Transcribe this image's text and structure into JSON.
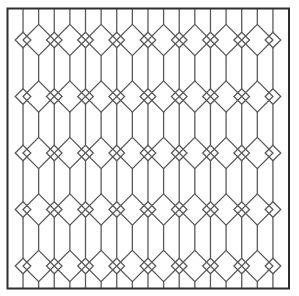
{
  "image": {
    "description": "Leaded glass lattice pattern of elongated hexagons and diamonds inside a square frame",
    "width": 299,
    "height": 296,
    "background": "#ffffff"
  },
  "frame": {
    "x": 7.5,
    "y": 8.5,
    "width": 281.5,
    "height": 280,
    "stroke": "#2e2e2e",
    "stroke_width": 2
  },
  "pattern": {
    "line_color": "#5a5a5a",
    "line_width": 1.3,
    "column_origin_x": 7.4,
    "column_pitch": 15.62,
    "column_count": 17,
    "first_column_type": "small",
    "band_centers_y": [
      40,
      96.5,
      153,
      209.5,
      266
    ],
    "large_diamond_half": 15.6,
    "small_diamond_half": 7.8
  }
}
